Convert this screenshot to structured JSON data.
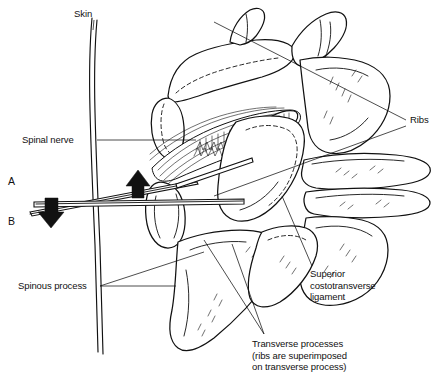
{
  "figure": {
    "background_color": "#ffffff",
    "ink_color": "#111111",
    "width": 440,
    "height": 375
  },
  "labels": {
    "skin": "Skin",
    "spinal_nerve": "Spinal nerve",
    "spinous_process": "Spinous process",
    "ribs": "Ribs",
    "superior_costotransverse_ligament": "Superior\ncostotransverse\nligament",
    "transverse_processes": "Transverse processes\n(ribs are superimposed\non transverse process)",
    "needle_a": "A",
    "needle_b": "B"
  },
  "structures": [
    {
      "name": "skin-surface",
      "label": "Skin"
    },
    {
      "name": "spinal-nerve",
      "label": "Spinal nerve"
    },
    {
      "name": "spinous-process",
      "label": "Spinous process"
    },
    {
      "name": "rib-upper",
      "label": "Ribs"
    },
    {
      "name": "rib-lower",
      "label": "Ribs"
    },
    {
      "name": "superior-costotransverse-ligament",
      "label": "Superior costotransverse ligament"
    },
    {
      "name": "transverse-process-upper",
      "label": "Transverse processes"
    },
    {
      "name": "transverse-process-lower",
      "label": "Transverse processes"
    }
  ],
  "needles": [
    {
      "name": "needle-a",
      "marker": "A",
      "description": "cephalad-angled needle path"
    },
    {
      "name": "needle-b",
      "marker": "B",
      "description": "horizontal needle path"
    }
  ],
  "arrows": [
    {
      "name": "needle-advance-arrow-down",
      "direction": "down"
    },
    {
      "name": "needle-advance-arrow-up",
      "direction": "up"
    }
  ]
}
